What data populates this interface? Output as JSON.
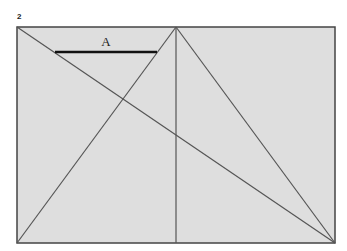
{
  "figure": {
    "number": "2",
    "segment_label": "A",
    "colors": {
      "fill": "#dedede",
      "stroke": "#444444",
      "thick_bar": "#111111"
    }
  }
}
